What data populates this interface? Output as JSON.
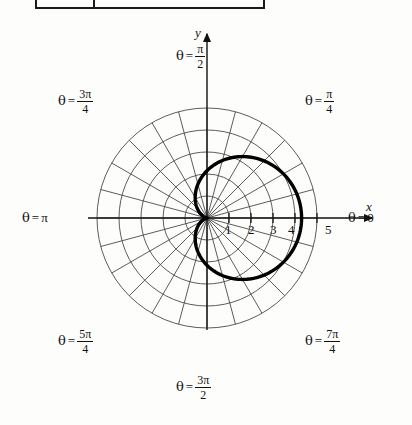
{
  "figure": {
    "kind": "polar-graph",
    "background_hex": "#fdfdfc",
    "ink_hex": "#111111",
    "grid_hex": "#555555",
    "curve_hex": "#000000"
  },
  "table_fragment": {
    "present": true,
    "description": "bottom edge of a table above the figure"
  },
  "axes": {
    "x_label": "x",
    "y_label": "y",
    "x_tick_labels": [
      "1",
      "2",
      "3",
      "4",
      "5"
    ],
    "x_tick_values": [
      1,
      2,
      3,
      4,
      5
    ]
  },
  "angle_labels": [
    {
      "name": "theta-0",
      "text": "θ = 0",
      "theta_deg": 0,
      "theta_text": "0",
      "numer": "",
      "denom": ""
    },
    {
      "name": "theta-pi-4",
      "text": "θ = π/4",
      "theta_deg": 45,
      "theta_text": "",
      "numer": "π",
      "denom": "4"
    },
    {
      "name": "theta-pi-2",
      "text": "θ = π/2",
      "theta_deg": 90,
      "theta_text": "",
      "numer": "π",
      "denom": "2"
    },
    {
      "name": "theta-3pi-4",
      "text": "θ = 3π/4",
      "theta_deg": 135,
      "theta_text": "",
      "numer": "3π",
      "denom": "4"
    },
    {
      "name": "theta-pi",
      "text": "θ = π",
      "theta_deg": 180,
      "theta_text": "π",
      "numer": "",
      "denom": ""
    },
    {
      "name": "theta-5pi-4",
      "text": "θ = 5π/4",
      "theta_deg": 225,
      "theta_text": "",
      "numer": "5π",
      "denom": "4"
    },
    {
      "name": "theta-3pi-2",
      "text": "θ = 3π/2",
      "theta_deg": 270,
      "theta_text": "",
      "numer": "3π",
      "denom": "2"
    },
    {
      "name": "theta-7pi-4",
      "text": "θ = 7π/4",
      "theta_deg": 315,
      "theta_text": "",
      "numer": "7π",
      "denom": "4"
    }
  ],
  "chart_data": {
    "type": "line",
    "coordinate_system": "polar",
    "title": "",
    "xlabel": "x",
    "ylabel": "y",
    "grid": true,
    "grid_circles_r": [
      1,
      2,
      3,
      4,
      5
    ],
    "grid_spokes_deg": [
      0,
      15,
      30,
      45,
      60,
      75,
      90,
      105,
      120,
      135,
      150,
      165,
      180,
      195,
      210,
      225,
      240,
      255,
      270,
      285,
      300,
      315,
      330,
      345
    ],
    "rlim": [
      0,
      5
    ],
    "legend": "none",
    "series": [
      {
        "name": "cardioid r = 2 + 2 cos(θ)",
        "equation": "r = 2 + 2cos(θ)",
        "r_max": 4.3,
        "r_at_0": 4.3,
        "r_at_90": 2.15,
        "r_at_180": 0,
        "r_at_270": 2.15,
        "theta_deg": [
          0,
          10,
          20,
          30,
          40,
          50,
          60,
          70,
          80,
          90,
          100,
          110,
          120,
          130,
          140,
          150,
          160,
          170,
          180,
          190,
          200,
          210,
          220,
          230,
          240,
          250,
          260,
          270,
          280,
          290,
          300,
          310,
          320,
          330,
          340,
          350,
          360
        ],
        "r": [
          4.3,
          4.27,
          4.17,
          4.01,
          3.8,
          3.53,
          3.23,
          2.89,
          2.52,
          2.15,
          1.78,
          1.41,
          1.08,
          0.77,
          0.5,
          0.29,
          0.13,
          0.03,
          0.0,
          0.03,
          0.13,
          0.29,
          0.5,
          0.77,
          1.08,
          1.41,
          1.78,
          2.15,
          2.52,
          2.89,
          3.23,
          3.53,
          3.8,
          4.01,
          4.17,
          4.27,
          4.3
        ]
      }
    ]
  }
}
